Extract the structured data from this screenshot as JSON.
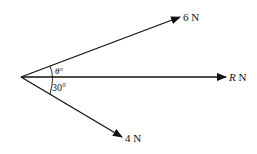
{
  "diagram": {
    "type": "force-vectors",
    "origin": [
      21,
      77
    ],
    "forces": [
      {
        "id": "six",
        "label": "6 N",
        "magnitude": "6",
        "unit": "N",
        "tip": [
          180,
          17
        ]
      },
      {
        "id": "resultant",
        "label_var": "R",
        "unit": "N",
        "tip": [
          226,
          77
        ]
      },
      {
        "id": "four",
        "label": "4 N",
        "magnitude": "4",
        "unit": "N",
        "tip": [
          122,
          137
        ]
      }
    ],
    "angles": [
      {
        "id": "theta",
        "label": "θ°",
        "between": [
          "6 N",
          "R N"
        ]
      },
      {
        "id": "thirty",
        "label": "30°",
        "between": [
          "R N",
          "4 N"
        ]
      }
    ]
  },
  "labels": {
    "six": "6 N",
    "r_var": "R",
    "r_unit": " N",
    "four": "4 N",
    "theta": "θ°",
    "thirty": "30°"
  }
}
